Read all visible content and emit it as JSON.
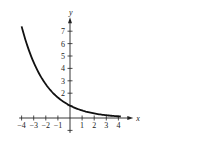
{
  "chart_data": {
    "type": "line",
    "title": "",
    "xlabel": "x",
    "ylabel": "y",
    "xlim": [
      -4.2,
      4.8
    ],
    "ylim": [
      -1.2,
      8
    ],
    "grid": false,
    "legend": null,
    "x_ticks": [
      -4,
      -3,
      -2,
      -1,
      1,
      2,
      3,
      4
    ],
    "x_tick_labels": [
      "−4",
      "−3",
      "−2",
      "−1",
      "1",
      "2",
      "3",
      "4"
    ],
    "y_ticks": [
      1,
      2,
      3,
      4,
      5,
      6,
      7
    ],
    "y_tick_labels": [
      "2",
      "3",
      "4",
      "5",
      "6",
      "7"
    ],
    "series": [
      {
        "name": "exponential decay curve",
        "function": "y = e^(-x/2)",
        "x": [
          -4,
          -3.5,
          -3,
          -2.5,
          -2,
          -1.5,
          -1,
          -0.5,
          0,
          0.5,
          1,
          1.5,
          2,
          2.5,
          3,
          3.5,
          4
        ],
        "values": [
          7.39,
          5.75,
          4.48,
          3.49,
          2.72,
          2.12,
          1.65,
          1.28,
          1.0,
          0.78,
          0.61,
          0.47,
          0.37,
          0.29,
          0.22,
          0.17,
          0.14
        ]
      }
    ]
  }
}
